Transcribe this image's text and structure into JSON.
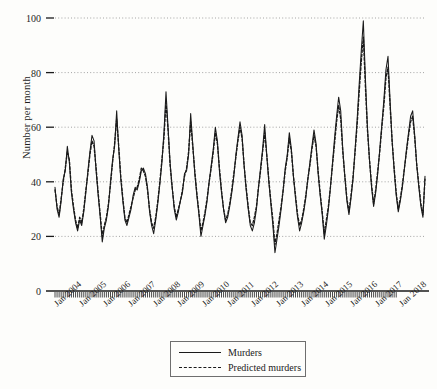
{
  "chart_data": {
    "type": "line",
    "title": "",
    "xlabel": "",
    "ylabel": "Number per month",
    "ylim": [
      0,
      100
    ],
    "yticks": [
      0,
      20,
      40,
      60,
      80,
      100
    ],
    "grid": true,
    "legend_position": "bottom-center",
    "x_tick_labels": [
      "Jan 2004",
      "Jan 2005",
      "Jan 2006",
      "Jan 2007",
      "Jan 2008",
      "Jan 2009",
      "Jan 2010",
      "Jan 2011",
      "Jan 2012",
      "Jan 2013",
      "Jan 2014",
      "Jan 2015",
      "Jan 2016",
      "Jan 2017",
      "Jan 2018"
    ],
    "x_start": "Jan 2004",
    "x_end": "Jan 2018",
    "x_frequency": "monthly",
    "series": [
      {
        "name": "Murders",
        "style": "solid",
        "color": "#1a1a1a",
        "values": [
          38,
          30,
          27,
          33,
          41,
          44,
          53,
          47,
          36,
          30,
          25,
          22,
          26,
          24,
          29,
          36,
          44,
          51,
          57,
          55,
          44,
          35,
          27,
          18,
          23,
          26,
          31,
          40,
          48,
          53,
          66,
          52,
          41,
          33,
          26,
          24,
          27,
          30,
          35,
          38,
          37,
          40,
          44,
          45,
          43,
          38,
          29,
          24,
          21,
          26,
          32,
          39,
          47,
          58,
          73,
          60,
          47,
          38,
          30,
          26,
          29,
          33,
          36,
          43,
          44,
          50,
          65,
          54,
          43,
          35,
          28,
          20,
          24,
          28,
          33,
          40,
          46,
          52,
          60,
          55,
          44,
          36,
          30,
          25,
          27,
          31,
          36,
          42,
          50,
          56,
          62,
          57,
          46,
          37,
          30,
          24,
          22,
          25,
          30,
          38,
          45,
          52,
          61,
          50,
          40,
          32,
          24,
          14,
          19,
          24,
          30,
          37,
          45,
          50,
          58,
          52,
          42,
          34,
          27,
          22,
          25,
          29,
          34,
          41,
          47,
          53,
          59,
          54,
          43,
          35,
          28,
          19,
          24,
          30,
          38,
          47,
          56,
          64,
          71,
          66,
          52,
          42,
          33,
          28,
          34,
          41,
          52,
          63,
          76,
          88,
          99,
          78,
          60,
          48,
          38,
          31,
          36,
          43,
          52,
          61,
          70,
          81,
          86,
          70,
          55,
          44,
          35,
          29,
          33,
          38,
          45,
          52,
          58,
          64,
          66,
          57,
          46,
          38,
          31,
          27,
          42
        ]
      },
      {
        "name": "Predicted murders",
        "style": "dashed",
        "color": "#1a1a1a",
        "values": [
          37,
          31,
          28,
          34,
          40,
          45,
          51,
          48,
          37,
          31,
          26,
          23,
          27,
          25,
          30,
          37,
          43,
          50,
          55,
          53,
          45,
          36,
          28,
          20,
          24,
          27,
          32,
          39,
          47,
          54,
          63,
          53,
          42,
          34,
          27,
          25,
          28,
          31,
          34,
          37,
          38,
          41,
          45,
          44,
          42,
          37,
          30,
          25,
          23,
          27,
          33,
          40,
          48,
          56,
          69,
          59,
          46,
          38,
          31,
          27,
          30,
          33,
          37,
          42,
          45,
          51,
          62,
          53,
          44,
          36,
          29,
          22,
          25,
          29,
          34,
          40,
          45,
          51,
          58,
          54,
          45,
          37,
          30,
          26,
          28,
          32,
          37,
          43,
          49,
          55,
          60,
          56,
          46,
          38,
          31,
          25,
          24,
          27,
          31,
          38,
          44,
          51,
          58,
          50,
          41,
          33,
          26,
          17,
          21,
          26,
          31,
          37,
          44,
          49,
          56,
          51,
          42,
          35,
          28,
          24,
          26,
          30,
          35,
          41,
          46,
          52,
          57,
          53,
          44,
          36,
          29,
          21,
          26,
          31,
          38,
          46,
          54,
          62,
          68,
          63,
          51,
          42,
          34,
          29,
          35,
          42,
          51,
          61,
          73,
          84,
          93,
          75,
          59,
          48,
          39,
          32,
          37,
          44,
          51,
          60,
          68,
          78,
          82,
          68,
          55,
          45,
          36,
          30,
          34,
          39,
          45,
          51,
          57,
          62,
          64,
          56,
          46,
          39,
          32,
          28,
          41
        ]
      }
    ]
  },
  "axes": {
    "y_title": "Number per month"
  },
  "legend": {
    "items": [
      {
        "label": "Murders",
        "style": "solid"
      },
      {
        "label": "Predicted murders",
        "style": "dashed"
      }
    ]
  }
}
